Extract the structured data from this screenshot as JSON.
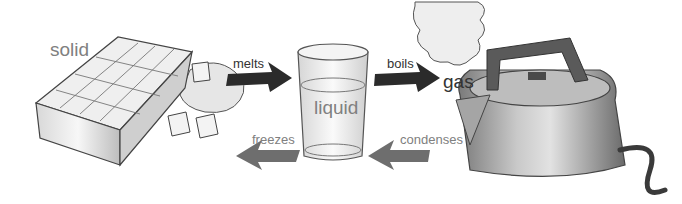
{
  "diagram": {
    "states": [
      {
        "id": "solid",
        "label": "solid",
        "object": "ice-cube-tray"
      },
      {
        "id": "liquid",
        "label": "liquid",
        "object": "glass-of-water"
      },
      {
        "id": "gas",
        "label": "gas",
        "object": "kettle-with-steam"
      }
    ],
    "transitions": [
      {
        "from": "solid",
        "to": "liquid",
        "label": "melts",
        "arrow_color": "#2b2b2b"
      },
      {
        "from": "liquid",
        "to": "gas",
        "label": "boils",
        "arrow_color": "#2b2b2b"
      },
      {
        "from": "gas",
        "to": "liquid",
        "label": "condenses",
        "arrow_color": "#6e6e6e"
      },
      {
        "from": "liquid",
        "to": "solid",
        "label": "freezes",
        "arrow_color": "#6e6e6e"
      }
    ]
  }
}
